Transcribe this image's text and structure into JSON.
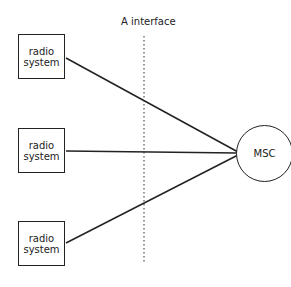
{
  "diagram": {
    "interface_label": "A interface",
    "radio_systems": [
      {
        "line1": "radio",
        "line2": "system"
      },
      {
        "line1": "radio",
        "line2": "system"
      },
      {
        "line1": "radio",
        "line2": "system"
      }
    ],
    "hub_label": "MSC",
    "colors": {
      "stroke": "#222222",
      "background": "#ffffff"
    }
  }
}
